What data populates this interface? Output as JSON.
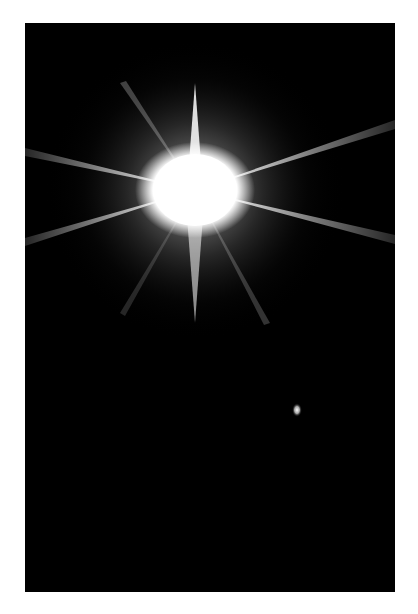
{
  "image": {
    "description": "Bright star with diffraction spikes against black space",
    "background": "#000000",
    "border": "#ffffff"
  },
  "star": {
    "cx": 170,
    "cy": 167
  },
  "companion": {
    "cx": 272,
    "cy": 387
  }
}
